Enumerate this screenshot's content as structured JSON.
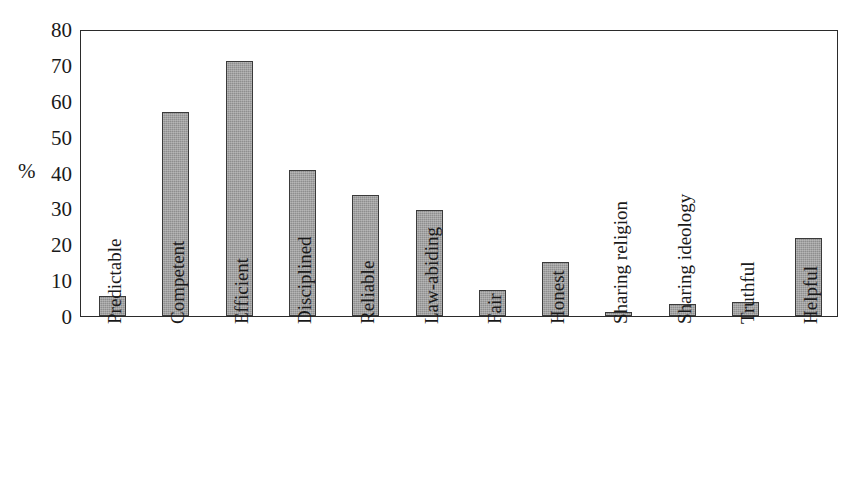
{
  "chart_data": {
    "type": "bar",
    "title": "",
    "subtitle": "",
    "xlabel": "",
    "ylabel": "%",
    "ylim": [
      0,
      80
    ],
    "yticks": [
      0,
      10,
      20,
      30,
      40,
      50,
      60,
      70,
      80
    ],
    "ytick_labels": [
      "0",
      "10",
      "20",
      "30",
      "40",
      "50",
      "60",
      "70",
      "80"
    ],
    "grid": false,
    "legend": false,
    "legend_position": "none",
    "bar_color": "#8e8e8e",
    "bar_edge_color": "#3a3a3a",
    "axis_color": "#2b2b2b",
    "background_color": "#ffffff",
    "categories": [
      "Predictable",
      "Competent",
      "Efficient",
      "Disciplined",
      "Reliable",
      "Law-abiding",
      "Fair",
      "Honest",
      "Sharing religion",
      "Sharing ideology",
      "Truthful",
      "Helpful"
    ],
    "values": [
      5.7,
      56.8,
      71.0,
      40.8,
      33.7,
      29.5,
      7.3,
      15.1,
      1.0,
      3.4,
      4.0,
      21.8
    ]
  }
}
